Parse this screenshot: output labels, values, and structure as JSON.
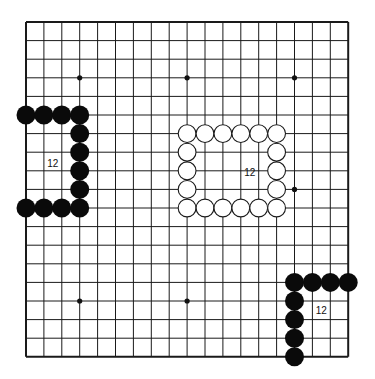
{
  "board": {
    "size": 19,
    "origin": {
      "x": 26,
      "y": 22
    },
    "spacing": {
      "x": 17.9,
      "y": 18.6
    },
    "line_color": "#1a1a1a",
    "background": "#ffffff",
    "stone_radius": 9.5,
    "hoshi": [
      [
        3,
        3
      ],
      [
        9,
        3
      ],
      [
        15,
        3
      ],
      [
        3,
        9
      ],
      [
        9,
        9
      ],
      [
        15,
        9
      ],
      [
        3,
        15
      ],
      [
        9,
        15
      ],
      [
        15,
        15
      ]
    ]
  },
  "groups": [
    {
      "name": "black-left-bracket",
      "color": "black",
      "stones": [
        [
          0,
          5
        ],
        [
          1,
          5
        ],
        [
          2,
          5
        ],
        [
          3,
          5
        ],
        [
          3,
          6
        ],
        [
          3,
          7
        ],
        [
          3,
          8
        ],
        [
          3,
          9
        ],
        [
          0,
          10
        ],
        [
          1,
          10
        ],
        [
          2,
          10
        ],
        [
          3,
          10
        ]
      ],
      "label": {
        "text": "12",
        "col": 1.5,
        "row": 7.6
      }
    },
    {
      "name": "white-center-ring",
      "color": "white",
      "stones": [
        [
          9,
          6
        ],
        [
          10,
          6
        ],
        [
          11,
          6
        ],
        [
          12,
          6
        ],
        [
          13,
          6
        ],
        [
          14,
          6
        ],
        [
          9,
          7
        ],
        [
          14,
          7
        ],
        [
          9,
          8
        ],
        [
          14,
          8
        ],
        [
          9,
          9
        ],
        [
          14,
          9
        ],
        [
          9,
          10
        ],
        [
          10,
          10
        ],
        [
          11,
          10
        ],
        [
          12,
          10
        ],
        [
          13,
          10
        ],
        [
          14,
          10
        ]
      ],
      "label": {
        "text": "12",
        "col": 12.5,
        "row": 8.1
      }
    },
    {
      "name": "black-bottom-right-corner",
      "color": "black",
      "stones": [
        [
          15,
          14
        ],
        [
          16,
          14
        ],
        [
          17,
          14
        ],
        [
          18,
          14
        ],
        [
          15,
          15
        ],
        [
          15,
          16
        ],
        [
          15,
          17
        ],
        [
          15,
          18
        ]
      ],
      "label": {
        "text": "12",
        "col": 16.5,
        "row": 15.5
      }
    }
  ]
}
